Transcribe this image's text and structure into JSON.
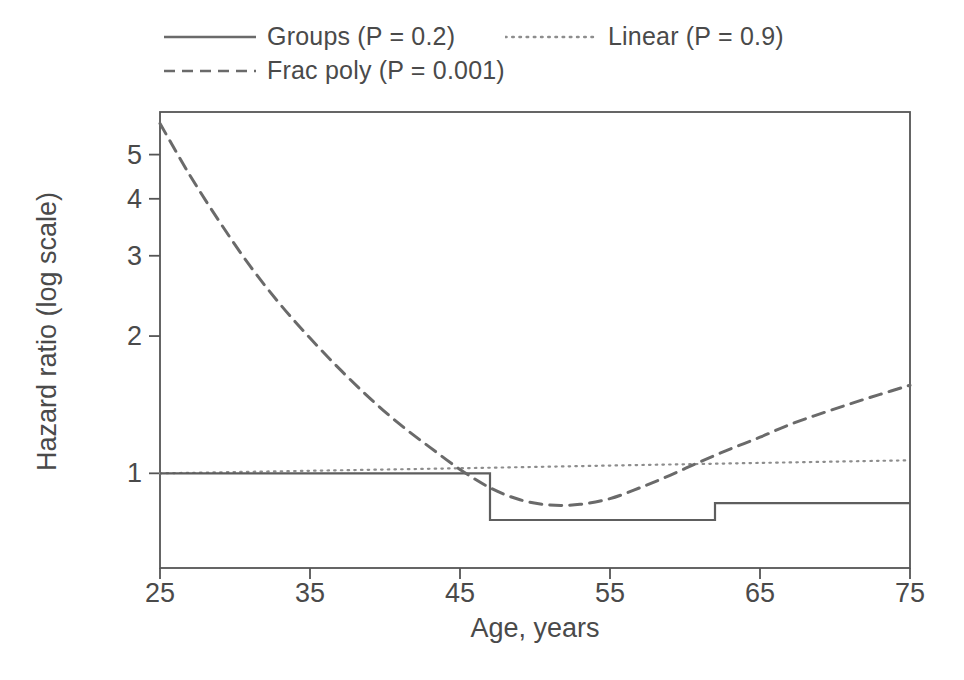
{
  "figure": {
    "width": 964,
    "height": 680,
    "background": "#ffffff",
    "ink_color": "#4a4a4a",
    "frame_color": "#555555"
  },
  "axis_titles": {
    "x": "Age, years",
    "y": "Hazard ratio (log scale)"
  },
  "legend": {
    "entries": [
      {
        "label": "Groups (P = 0.2)",
        "style": "solid",
        "key": "solid-line-key"
      },
      {
        "label": "Linear (P = 0.9)",
        "style": "dotted",
        "key": "dotted-line-key"
      },
      {
        "label": "Frac poly (P = 0.001)",
        "style": "dashed",
        "key": "dashed-line-key"
      }
    ]
  },
  "chart_data": {
    "type": "line",
    "title": "",
    "xlabel": "Age, years",
    "ylabel": "Hazard ratio (log scale)",
    "yscale": "log",
    "xlim": [
      25,
      75
    ],
    "ylim": [
      0.62,
      6.2
    ],
    "grid": false,
    "legend_position": "above-plot",
    "xticks": [
      25,
      35,
      45,
      55,
      65,
      75
    ],
    "yticks": [
      1,
      2,
      3,
      4,
      5
    ],
    "xtick_labels": [
      "25",
      "35",
      "45",
      "55",
      "65",
      "75"
    ],
    "ytick_labels": [
      "1",
      "2",
      "3",
      "4",
      "5"
    ],
    "series": [
      {
        "name": "Groups (P = 0.2)",
        "style": "solid",
        "type": "step",
        "description": "Piecewise-constant hazard ratio by age group",
        "steps": [
          {
            "x_start": 25,
            "x_end": 47,
            "value": 1.0
          },
          {
            "x_start": 47,
            "x_end": 62,
            "value": 0.79
          },
          {
            "x_start": 62,
            "x_end": 75,
            "value": 0.86
          }
        ]
      },
      {
        "name": "Linear (P = 0.9)",
        "style": "dotted",
        "type": "line",
        "description": "Linear age term on log hazard scale, nearly flat",
        "x": [
          25,
          35,
          45,
          55,
          65,
          75
        ],
        "y": [
          1.0,
          1.013,
          1.026,
          1.04,
          1.054,
          1.068
        ]
      },
      {
        "name": "Frac poly (P = 0.001)",
        "style": "dashed",
        "type": "line",
        "description": "Fractional polynomial fit: steep decline from age 25, minimum near age 50, then rising",
        "x": [
          25,
          27,
          29,
          31,
          33,
          35,
          37,
          39,
          41,
          43,
          45,
          47,
          49,
          51,
          53,
          55,
          57,
          59,
          61,
          63,
          65,
          67,
          69,
          71,
          73,
          75
        ],
        "y": [
          5.85,
          4.5,
          3.55,
          2.85,
          2.35,
          1.98,
          1.69,
          1.46,
          1.28,
          1.14,
          1.02,
          0.93,
          0.875,
          0.852,
          0.855,
          0.88,
          0.93,
          0.99,
          1.06,
          1.13,
          1.2,
          1.28,
          1.35,
          1.42,
          1.49,
          1.56
        ]
      }
    ]
  }
}
